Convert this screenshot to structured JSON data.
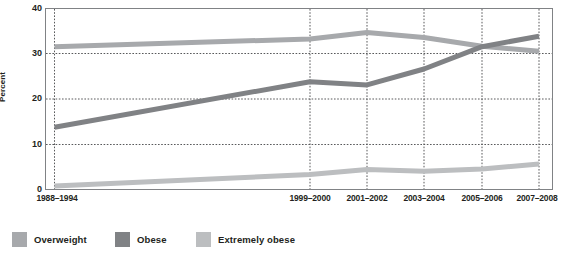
{
  "chart_data": {
    "type": "line",
    "title": "",
    "subtitle": "",
    "xlabel": "",
    "ylabel": "Percent",
    "ylim": [
      0,
      40
    ],
    "yticks": [
      0,
      10,
      20,
      30,
      40
    ],
    "grid": "horizontal dotted at 10, 20, 30; vertical dotted at each period",
    "legend_position": "bottom-left",
    "categories": [
      "1988–1994",
      "1999–2000",
      "2001–2002",
      "2003–2004",
      "2005–2006",
      "2007–2008"
    ],
    "series": [
      {
        "name": "Overweight",
        "color": "#a7a9ac",
        "values": [
          31.5,
          33.2,
          34.6,
          33.5,
          31.6,
          30.5
        ]
      },
      {
        "name": "Obese",
        "color": "#808285",
        "values": [
          13.8,
          23.8,
          23.1,
          26.6,
          31.5,
          33.8
        ]
      },
      {
        "name": "Extremely obese",
        "color": "#bcbec0",
        "values": [
          0.9,
          3.4,
          4.5,
          4.1,
          4.6,
          5.7
        ]
      }
    ]
  },
  "axis": {
    "y_label": "Percent",
    "y_ticks": [
      "40",
      "30",
      "20",
      "10",
      "0"
    ],
    "x_ticks": [
      "1988–1994",
      "1999–2000",
      "2001–2002",
      "2003–2004",
      "2005–2006",
      "2007–2008"
    ]
  },
  "legend": {
    "items": [
      {
        "label": "Overweight",
        "color": "#a7a9ac"
      },
      {
        "label": "Obese",
        "color": "#808285"
      },
      {
        "label": "Extremely obese",
        "color": "#bcbec0"
      }
    ]
  },
  "style": {
    "axis_color": "#808285",
    "grid_color": "#58595b",
    "text_color": "#231f20",
    "background": "#ffffff"
  }
}
